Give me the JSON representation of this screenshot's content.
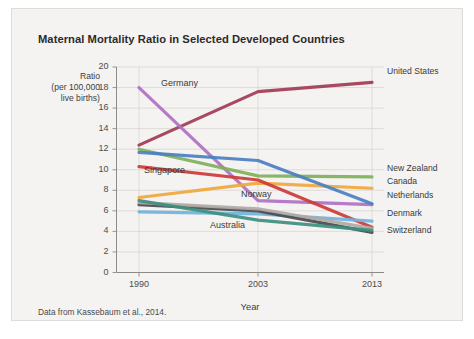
{
  "chart_data": {
    "type": "line",
    "title": "Maternal Mortality Ratio in Selected Developed Countries",
    "xlabel": "Year",
    "ylabel": "Ratio (per 100,000 live births)",
    "ylabel_lines": [
      "Ratio",
      "(per 100,000",
      "live births)"
    ],
    "source_note": "Data from Kassebaum et al., 2014.",
    "x": [
      1990,
      2003,
      2013
    ],
    "categories": [
      "1990",
      "2003",
      "2013"
    ],
    "xticklabels": [
      "1990",
      "2003",
      "2013"
    ],
    "yticklabels": [
      "0",
      "2",
      "4",
      "6",
      "8",
      "10",
      "12",
      "14",
      "16",
      "18",
      "20"
    ],
    "ylim": [
      0,
      20
    ],
    "ytick_step": 2,
    "grid": "horizontal-and-vertical",
    "legend_position": "right-of-plot-and-inline-annotations",
    "series": [
      {
        "name": "United States",
        "values": [
          12.4,
          17.6,
          18.5
        ],
        "color": "#a23b55",
        "label_side": "right",
        "label_y": 72
      },
      {
        "name": "Germany",
        "values": [
          18.0,
          7.0,
          6.6
        ],
        "color": "#b070c4",
        "label_side": "inline",
        "label_x": 161,
        "label_y": 84
      },
      {
        "name": "New Zealand",
        "values": [
          12.0,
          9.4,
          9.3
        ],
        "color": "#7fb05a",
        "label_side": "right",
        "label_y": 169
      },
      {
        "name": "Canada",
        "values": [
          7.3,
          8.7,
          8.2
        ],
        "color": "#f0a73c",
        "label_side": "right",
        "label_y": 182
      },
      {
        "name": "Netherlands",
        "values": [
          11.7,
          10.9,
          6.7
        ],
        "color": "#4a7fc1",
        "label_side": "right",
        "label_y": 196
      },
      {
        "name": "Singapore",
        "values": [
          10.3,
          9.0,
          4.4
        ],
        "color": "#cc3b38",
        "label_side": "inline",
        "label_x": 144,
        "label_y": 171
      },
      {
        "name": "Denmark",
        "values": [
          5.9,
          5.7,
          5.0
        ],
        "color": "#6fb3dd",
        "label_side": "right",
        "label_y": 214
      },
      {
        "name": "Switzerland",
        "values": [
          6.6,
          6.0,
          3.9
        ],
        "color": "#4a4a4f",
        "label_side": "right",
        "label_y": 231
      },
      {
        "name": "Norway",
        "values": [
          6.8,
          6.2,
          4.3
        ],
        "color": "#b0a9a4",
        "label_side": "inline",
        "label_x": 241,
        "label_y": 195
      },
      {
        "name": "Australia",
        "values": [
          7.0,
          5.1,
          4.1
        ],
        "color": "#3d8f7f",
        "label_side": "inline",
        "label_x": 210,
        "label_y": 226
      }
    ]
  }
}
